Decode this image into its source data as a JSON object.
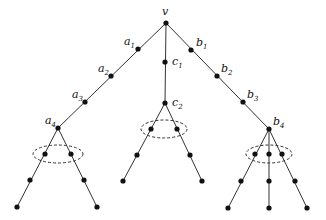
{
  "diagram": {
    "type": "tree",
    "root": {
      "id": "v",
      "label": "v",
      "x": 166,
      "y": 23
    },
    "nodes": [
      {
        "id": "v",
        "x": 166,
        "y": 23
      },
      {
        "id": "a1",
        "x": 138,
        "y": 49
      },
      {
        "id": "a2",
        "x": 111,
        "y": 76
      },
      {
        "id": "a3",
        "x": 85,
        "y": 102
      },
      {
        "id": "a4",
        "x": 58,
        "y": 128
      },
      {
        "id": "c1",
        "x": 165,
        "y": 62
      },
      {
        "id": "c2",
        "x": 165,
        "y": 103
      },
      {
        "id": "b1",
        "x": 191,
        "y": 50
      },
      {
        "id": "b2",
        "x": 217,
        "y": 76
      },
      {
        "id": "b3",
        "x": 243,
        "y": 102
      },
      {
        "id": "b4",
        "x": 269,
        "y": 129
      },
      {
        "id": "aL1",
        "x": 45,
        "y": 154
      },
      {
        "id": "aL2",
        "x": 30,
        "y": 180
      },
      {
        "id": "aL3",
        "x": 17,
        "y": 207
      },
      {
        "id": "aR1",
        "x": 71,
        "y": 154
      },
      {
        "id": "aR2",
        "x": 84,
        "y": 180
      },
      {
        "id": "aR3",
        "x": 97,
        "y": 207
      },
      {
        "id": "cL1",
        "x": 151,
        "y": 129
      },
      {
        "id": "cL2",
        "x": 137,
        "y": 155
      },
      {
        "id": "cL3",
        "x": 123,
        "y": 181
      },
      {
        "id": "cR1",
        "x": 177,
        "y": 129
      },
      {
        "id": "cR2",
        "x": 190,
        "y": 155
      },
      {
        "id": "cR3",
        "x": 202,
        "y": 181
      },
      {
        "id": "bL1",
        "x": 255,
        "y": 154
      },
      {
        "id": "bL2",
        "x": 241,
        "y": 181
      },
      {
        "id": "bL3",
        "x": 228,
        "y": 208
      },
      {
        "id": "bM1",
        "x": 269,
        "y": 154
      },
      {
        "id": "bM2",
        "x": 269,
        "y": 181
      },
      {
        "id": "bM3",
        "x": 269,
        "y": 208
      },
      {
        "id": "bR1",
        "x": 282,
        "y": 154
      },
      {
        "id": "bR2",
        "x": 295,
        "y": 181
      },
      {
        "id": "bR3",
        "x": 307,
        "y": 208
      }
    ],
    "edges": [
      [
        166,
        23,
        58,
        128
      ],
      [
        166,
        23,
        165,
        103
      ],
      [
        166,
        23,
        269,
        129
      ],
      [
        58,
        128,
        17,
        207
      ],
      [
        58,
        128,
        97,
        207
      ],
      [
        165,
        103,
        123,
        181
      ],
      [
        165,
        103,
        202,
        181
      ],
      [
        269,
        129,
        228,
        208
      ],
      [
        269,
        129,
        269,
        208
      ],
      [
        269,
        129,
        307,
        208
      ]
    ],
    "ellipses": [
      {
        "name": "a-branch-cluster",
        "cx": 58,
        "cy": 154,
        "rx": 25,
        "ry": 9
      },
      {
        "name": "c-branch-cluster",
        "cx": 164,
        "cy": 129,
        "rx": 23,
        "ry": 9
      },
      {
        "name": "b-branch-cluster",
        "cx": 269,
        "cy": 154,
        "rx": 23,
        "ry": 9
      }
    ],
    "labels": {
      "v": {
        "base": "v",
        "sub": "",
        "x": 162,
        "y": 15
      },
      "a1": {
        "base": "a",
        "sub": "1",
        "x": 124,
        "y": 45
      },
      "a2": {
        "base": "a",
        "sub": "2",
        "x": 98,
        "y": 72
      },
      "a3": {
        "base": "a",
        "sub": "3",
        "x": 72,
        "y": 98
      },
      "a4": {
        "base": "a",
        "sub": "4",
        "x": 45,
        "y": 124
      },
      "c1": {
        "base": "c",
        "sub": "1",
        "x": 172,
        "y": 65
      },
      "c2": {
        "base": "c",
        "sub": "2",
        "x": 172,
        "y": 106
      },
      "b1": {
        "base": "b",
        "sub": "1",
        "x": 196,
        "y": 46
      },
      "b2": {
        "base": "b",
        "sub": "2",
        "x": 221,
        "y": 72
      },
      "b3": {
        "base": "b",
        "sub": "3",
        "x": 247,
        "y": 98
      },
      "b4": {
        "base": "b",
        "sub": "4",
        "x": 273,
        "y": 125
      }
    }
  }
}
